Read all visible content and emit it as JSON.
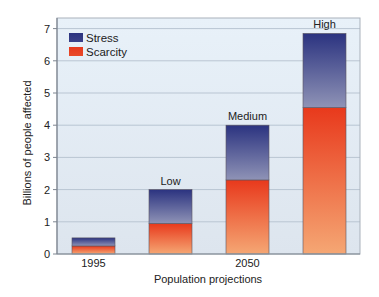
{
  "chart_data": {
    "type": "bar",
    "stacked": true,
    "title": "",
    "xlabel": "Population projections",
    "ylabel": "Billions of people affected",
    "ylim": [
      0,
      7.4
    ],
    "yticks": [
      0,
      1,
      2,
      3,
      4,
      5,
      6,
      7
    ],
    "grid": true,
    "legend_position": "upper left",
    "categories": [
      "1995",
      "Low",
      "Medium",
      "High"
    ],
    "bar_labels": [
      "",
      "Low",
      "Medium",
      "High"
    ],
    "x_tick_labels": [
      {
        "category_index": 0,
        "label": "1995"
      },
      {
        "category_index": 2,
        "label": "2050"
      }
    ],
    "series": [
      {
        "name": "Scarcity",
        "values": [
          0.25,
          0.95,
          2.3,
          4.55
        ],
        "color_top": "#e8391c",
        "color_bottom": "#f5a774"
      },
      {
        "name": "Stress",
        "values": [
          0.25,
          1.05,
          1.7,
          2.3
        ],
        "color_top": "#2b3380",
        "color_bottom": "#8f93b6"
      }
    ],
    "totals": [
      0.5,
      2.0,
      4.0,
      6.85
    ],
    "legend": [
      {
        "name": "Stress",
        "color": "#3a4189"
      },
      {
        "name": "Scarcity",
        "color": "#e84a2a"
      }
    ]
  },
  "colors": {
    "plot_bg_top": "#e8f1f9",
    "plot_bg_bottom": "#dde5ee",
    "grid": "#b9c5d2",
    "frame": "#7d8590"
  }
}
